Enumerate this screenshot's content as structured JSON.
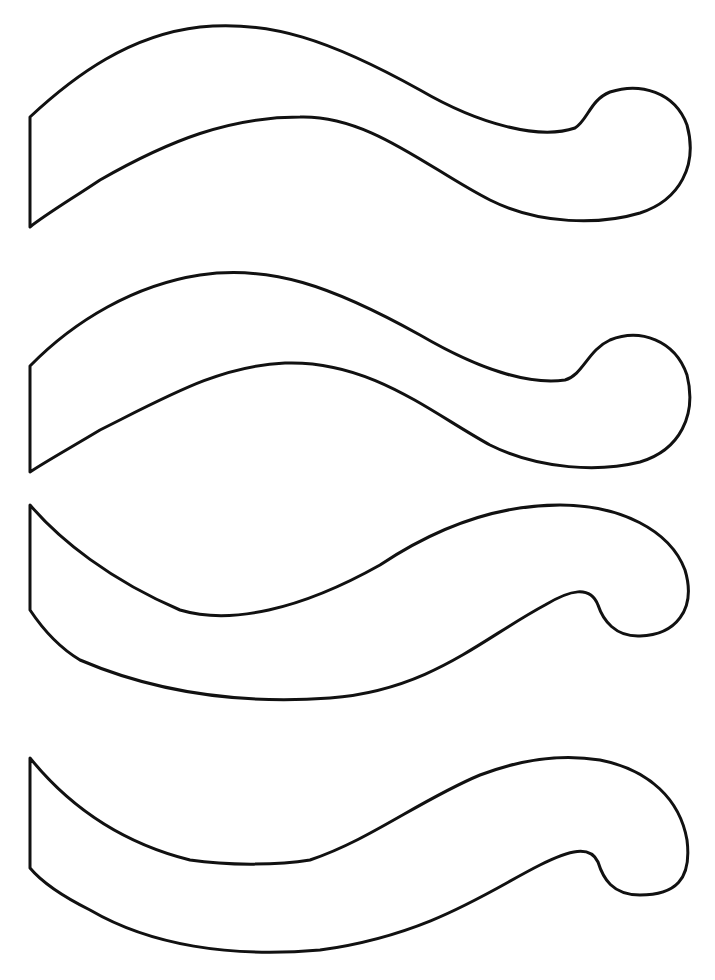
{
  "page": {
    "title": "",
    "background": "#ffffff",
    "stroke_color": "#111111"
  },
  "shapes": [
    {
      "id": "wave-1",
      "orientation": "hook-down",
      "top": 26,
      "bottom": 227
    },
    {
      "id": "wave-2",
      "orientation": "hook-down",
      "top": 272,
      "bottom": 472
    },
    {
      "id": "wave-3",
      "orientation": "hook-up",
      "top": 505,
      "bottom": 700
    },
    {
      "id": "wave-4",
      "orientation": "hook-up",
      "top": 755,
      "bottom": 955
    }
  ]
}
